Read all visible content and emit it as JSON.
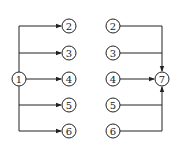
{
  "diagrams": [
    {
      "name": "split-diagram",
      "source": {
        "label": "1",
        "x": 19,
        "y": 79
      },
      "trunk_x": 19,
      "targets": [
        {
          "label": "2",
          "x": 69,
          "y": 26
        },
        {
          "label": "3",
          "x": 69,
          "y": 53
        },
        {
          "label": "4",
          "x": 69,
          "y": 79
        },
        {
          "label": "5",
          "x": 69,
          "y": 105
        },
        {
          "label": "6",
          "x": 69,
          "y": 131
        }
      ]
    },
    {
      "name": "merge-diagram",
      "sources": [
        {
          "label": "2",
          "x": 113,
          "y": 26
        },
        {
          "label": "3",
          "x": 113,
          "y": 53
        },
        {
          "label": "4",
          "x": 113,
          "y": 79
        },
        {
          "label": "5",
          "x": 113,
          "y": 105
        },
        {
          "label": "6",
          "x": 113,
          "y": 131
        }
      ],
      "trunk_x": 162,
      "target": {
        "label": "7",
        "x": 162,
        "y": 79
      }
    }
  ],
  "style": {
    "stroke": "#222222",
    "fill": "#ffffff",
    "node_radius": 7
  }
}
